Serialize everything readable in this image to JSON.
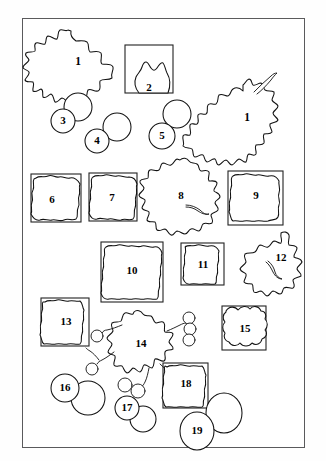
{
  "plate": {
    "title": "Particle shape morphology plate",
    "description": "Line drawings of nineteen numbered outline shapes arranged inside a thin rectangular frame.",
    "frame": {
      "stroke_color": "#5a5a5c",
      "background_color": "#ffffff",
      "x": 22,
      "y": 18,
      "width": 283,
      "height": 430
    },
    "ink_color": "#111111",
    "label_color": "#000000"
  },
  "shapes": [
    {
      "id": 1,
      "label": "1",
      "kind": "irregular-lobed-blob",
      "label_x": 78,
      "label_y": 62,
      "row": 1
    },
    {
      "id": 2,
      "label": "2",
      "kind": "blob-inside-square-box",
      "label_x": 149,
      "label_y": 88,
      "row": 1
    },
    {
      "id": 3,
      "label": "3",
      "kind": "two-overlapping-circles",
      "label_x": 63,
      "label_y": 121,
      "row": 2
    },
    {
      "id": 4,
      "label": "4",
      "kind": "two-overlapping-circles",
      "label_x": 97,
      "label_y": 140,
      "row": 2
    },
    {
      "id": 5,
      "label": "5",
      "kind": "two-overlapping-circles",
      "label_x": 162,
      "label_y": 136,
      "row": 2
    },
    {
      "id": 6,
      "label": "6",
      "kind": "crenulated-square",
      "label_x": 52,
      "label_y": 200,
      "row": 3
    },
    {
      "id": 7,
      "label": "7",
      "kind": "crenulated-square",
      "label_x": 112,
      "label_y": 198,
      "row": 3
    },
    {
      "id": 8,
      "label": "8",
      "kind": "spiky-cloud-blob",
      "label_x": 181,
      "label_y": 196,
      "row": 3
    },
    {
      "id": 9,
      "label": "9",
      "kind": "crenulated-square",
      "label_x": 256,
      "label_y": 196,
      "row": 3
    },
    {
      "id": 10,
      "label": "10",
      "kind": "crenulated-square",
      "label_x": 132,
      "label_y": 271,
      "row": 4
    },
    {
      "id": 11,
      "label": "11",
      "kind": "crenulated-square",
      "label_x": 203,
      "label_y": 265,
      "row": 4
    },
    {
      "id": 12,
      "label": "12",
      "kind": "irregular-lobed-blob",
      "label_x": 281,
      "label_y": 258,
      "row": 4
    },
    {
      "id": 13,
      "label": "13",
      "kind": "crenulated-square",
      "label_x": 66,
      "label_y": 322,
      "row": 5
    },
    {
      "id": 14,
      "label": "14",
      "kind": "dendritic-branching-cluster",
      "label_x": 141,
      "label_y": 344,
      "row": 5
    },
    {
      "id": 15,
      "label": "15",
      "kind": "crenulated-square",
      "label_x": 245,
      "label_y": 329,
      "row": 5
    },
    {
      "id": 16,
      "label": "16",
      "kind": "two-overlapping-circles",
      "label_x": 65,
      "label_y": 388,
      "row": 6
    },
    {
      "id": 17,
      "label": "17",
      "kind": "two-overlapping-circles",
      "label_x": 127,
      "label_y": 408,
      "row": 6
    },
    {
      "id": 18,
      "label": "18",
      "kind": "crenulated-square",
      "label_x": 186,
      "label_y": 384,
      "row": 6
    },
    {
      "id": 19,
      "label": "19",
      "kind": "two-overlapping-circles",
      "label_x": 197,
      "label_y": 431,
      "row": 6
    }
  ]
}
